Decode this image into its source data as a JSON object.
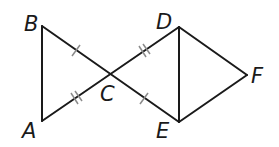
{
  "diagram": {
    "type": "geometry",
    "points": {
      "A": {
        "label": "A",
        "x": 42,
        "y": 121
      },
      "B": {
        "label": "B",
        "x": 42,
        "y": 26
      },
      "C": {
        "label": "C",
        "x": 110,
        "y": 75
      },
      "D": {
        "label": "D",
        "x": 179,
        "y": 27
      },
      "E": {
        "label": "E",
        "x": 179,
        "y": 122
      },
      "F": {
        "label": "F",
        "x": 247,
        "y": 75
      }
    },
    "segments": [
      "AB",
      "BE",
      "AD",
      "DE",
      "DF",
      "EF"
    ],
    "congruence_marks": [
      {
        "segment": "BC",
        "ticks": 1
      },
      {
        "segment": "CE",
        "ticks": 1
      },
      {
        "segment": "AC",
        "ticks": 2
      },
      {
        "segment": "CD",
        "ticks": 2
      }
    ],
    "colors": {
      "line": "#1a1a1a",
      "tick": "#8a8a8a"
    }
  }
}
